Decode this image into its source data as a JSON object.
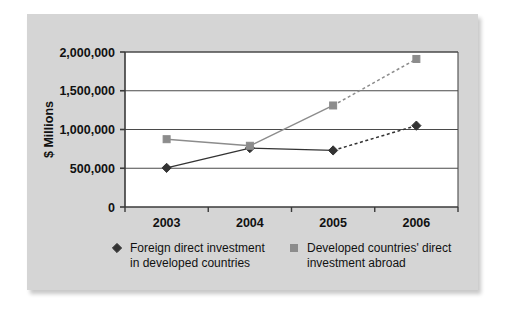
{
  "figure": {
    "panel_color": "#d5d5d5",
    "plot_background": "#ffffff",
    "axis_color": "#3a3a3a",
    "grid_color": "#4a4a4a"
  },
  "chart_data": {
    "type": "line",
    "title": "",
    "xlabel": "",
    "ylabel": "$ Millions",
    "categories": [
      "2003",
      "2004",
      "2005",
      "2006"
    ],
    "ylim": [
      0,
      2000000
    ],
    "yticks": [
      0,
      500000,
      1000000,
      1500000,
      2000000
    ],
    "ytick_labels": [
      "0",
      "500,000",
      "1,000,000",
      "1,500,000",
      "2,000,000"
    ],
    "grid": "horizontal",
    "legend_position": "bottom",
    "series": [
      {
        "name": "Foreign direct investment in developed countries",
        "legend_line1": "Foreign direct investment",
        "legend_line2": "in developed countries",
        "marker": "diamond",
        "color": "#333333",
        "values": [
          505000,
          760000,
          730000,
          1050000
        ],
        "dashed_from_index": 2
      },
      {
        "name": "Developed countries' direct investment abroad",
        "legend_line1": "Developed countries' direct",
        "legend_line2": "investment abroad",
        "marker": "square",
        "color": "#8c8c8c",
        "values": [
          875000,
          790000,
          1310000,
          1910000
        ],
        "dashed_from_index": 2
      }
    ]
  }
}
